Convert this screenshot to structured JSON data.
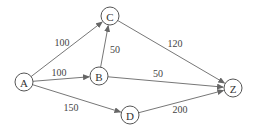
{
  "graph": {
    "nodes": [
      {
        "id": "A",
        "label": "A",
        "x": 24,
        "y": 82
      },
      {
        "id": "B",
        "label": "B",
        "x": 99,
        "y": 76
      },
      {
        "id": "C",
        "label": "C",
        "x": 110,
        "y": 16
      },
      {
        "id": "D",
        "label": "D",
        "x": 130,
        "y": 115
      },
      {
        "id": "Z",
        "label": "Z",
        "x": 233,
        "y": 88
      }
    ],
    "edges": [
      {
        "from": "A",
        "to": "C",
        "weight": "100",
        "lx": 62,
        "ly": 42
      },
      {
        "from": "A",
        "to": "B",
        "weight": "100",
        "lx": 59,
        "ly": 72
      },
      {
        "from": "B",
        "to": "C",
        "weight": "50",
        "lx": 115,
        "ly": 49
      },
      {
        "from": "A",
        "to": "D",
        "weight": "150",
        "lx": 71,
        "ly": 107
      },
      {
        "from": "C",
        "to": "Z",
        "weight": "120",
        "lx": 175,
        "ly": 43
      },
      {
        "from": "B",
        "to": "Z",
        "weight": "50",
        "lx": 158,
        "ly": 73
      },
      {
        "from": "D",
        "to": "Z",
        "weight": "200",
        "lx": 180,
        "ly": 109
      }
    ],
    "node_radius": 9
  }
}
